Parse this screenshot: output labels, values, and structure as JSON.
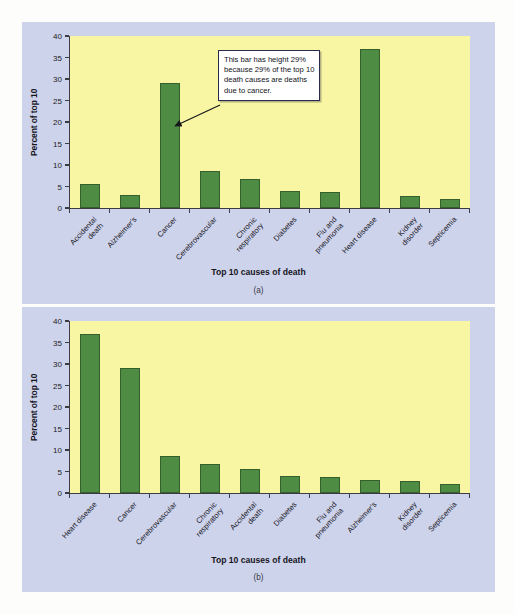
{
  "figure": {
    "background_color": "#ced3ec",
    "plot_background_color": "#f8f5a3",
    "bar_color": "#4e8b43",
    "bar_edge_color": "#35602e",
    "axis_color": "#3c3c42"
  },
  "panel_a": {
    "caption": "(a)",
    "annotation": {
      "line1": "This bar has height 29%",
      "line2": "because 29% of the top 10",
      "line3": "death causes are deaths",
      "line4": "due to cancer.",
      "points_to": "Cancer"
    }
  },
  "panel_b": {
    "caption": "(b)"
  },
  "chart_data": [
    {
      "type": "bar",
      "title": "",
      "xlabel": "Top 10 causes of death",
      "ylabel": "Percent of top 10",
      "ylim": [
        0,
        40
      ],
      "yticks": [
        0,
        5,
        10,
        15,
        20,
        25,
        30,
        35,
        40
      ],
      "grid": false,
      "legend": "none",
      "order": "alphabetical",
      "categories": [
        "Accidental death",
        "Alzheimer's",
        "Cancer",
        "Cerebrovascular",
        "Chronic respiratory",
        "Diabetes",
        "Flu and pneumonia",
        "Heart disease",
        "Kidney disorder",
        "Septicemia"
      ],
      "category_lines": [
        [
          "Accidental",
          "death"
        ],
        [
          "Alzheimer's"
        ],
        [
          "Cancer"
        ],
        [
          "Cerebrovascular"
        ],
        [
          "Chronic",
          "respiratory"
        ],
        [
          "Diabetes"
        ],
        [
          "Flu and",
          "pneumonia"
        ],
        [
          "Heart disease"
        ],
        [
          "Kidney",
          "disorder"
        ],
        [
          "Septicemia"
        ]
      ],
      "values": [
        5.5,
        3.0,
        29.0,
        8.7,
        6.8,
        4.0,
        3.8,
        37.0,
        2.7,
        2.0
      ]
    },
    {
      "type": "bar",
      "title": "",
      "xlabel": "Top 10 causes of death",
      "ylabel": "Percent of top 10",
      "ylim": [
        0,
        40
      ],
      "yticks": [
        0,
        5,
        10,
        15,
        20,
        25,
        30,
        35,
        40
      ],
      "grid": false,
      "legend": "none",
      "order": "descending",
      "categories": [
        "Heart disease",
        "Cancer",
        "Cerebrovascular",
        "Chronic respiratory",
        "Accidental death",
        "Diabetes",
        "Flu and pneumonia",
        "Alzheimer's",
        "Kidney disorder",
        "Septicemia"
      ],
      "category_lines": [
        [
          "Heart disease"
        ],
        [
          "Cancer"
        ],
        [
          "Cerebrovascular"
        ],
        [
          "Chronic",
          "respiratory"
        ],
        [
          "Accidental",
          "death"
        ],
        [
          "Diabetes"
        ],
        [
          "Flu and",
          "pneumonia"
        ],
        [
          "Alzheimer's"
        ],
        [
          "Kidney",
          "disorder"
        ],
        [
          "Septicemia"
        ]
      ],
      "values": [
        37.0,
        29.0,
        8.7,
        6.8,
        5.5,
        4.0,
        3.8,
        3.0,
        2.7,
        2.0
      ]
    }
  ]
}
